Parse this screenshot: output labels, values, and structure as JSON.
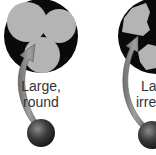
{
  "panels": [
    {
      "label_line1": "Large,",
      "label_line2": "round",
      "shape": "round"
    },
    {
      "label_line1": "Large,",
      "label_line2": "irregular",
      "shape": "irregular"
    }
  ],
  "colors": {
    "pore": "#0a0a0a",
    "particle": "#b4b4b4",
    "arrow": "#8a8a8a",
    "sphere": "#3a3a3a"
  }
}
